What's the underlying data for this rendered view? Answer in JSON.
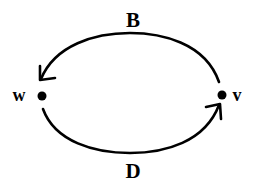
{
  "diagram": {
    "type": "directed-graph",
    "colors": {
      "stroke": "#000000",
      "background": "#ffffff"
    },
    "nodes": [
      {
        "id": "w",
        "label": "w"
      },
      {
        "id": "v",
        "label": "v"
      }
    ],
    "edges": [
      {
        "id": "B",
        "label": "B",
        "from": "v",
        "to": "w",
        "position": "top"
      },
      {
        "id": "D",
        "label": "D",
        "from": "w",
        "to": "v",
        "position": "bottom"
      }
    ]
  }
}
